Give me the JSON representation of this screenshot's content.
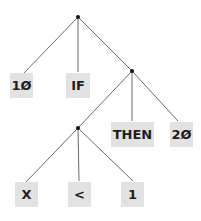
{
  "diagram": {
    "type": "parse-tree",
    "nodes": {
      "root": {
        "x": 78,
        "y": 17
      },
      "then_clause": {
        "x": 132,
        "y": 71
      },
      "condition": {
        "x": 78,
        "y": 128
      }
    },
    "leaves": [
      {
        "id": "leaf-10",
        "label": "1Ø",
        "parent": "root"
      },
      {
        "id": "leaf-if",
        "label": "IF",
        "parent": "root"
      },
      {
        "id": "leaf-then",
        "label": "THEN",
        "parent": "then_clause"
      },
      {
        "id": "leaf-20",
        "label": "2Ø",
        "parent": "then_clause"
      },
      {
        "id": "leaf-x",
        "label": "X",
        "parent": "condition"
      },
      {
        "id": "leaf-lt",
        "label": "<",
        "parent": "condition"
      },
      {
        "id": "leaf-1",
        "label": "1",
        "parent": "condition"
      }
    ],
    "colors": {
      "box": "#e2e2e2",
      "line": "#333333",
      "text": "#1e1e1e"
    }
  }
}
